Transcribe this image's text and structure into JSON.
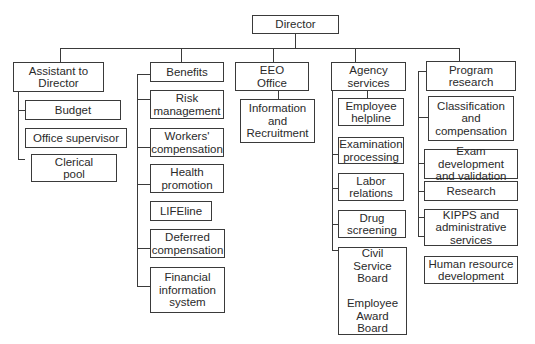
{
  "chart": {
    "root": "Director",
    "departments": [
      {
        "label": "Assistant to\nDirector",
        "children": [
          "Budget",
          "Office supervisor"
        ],
        "sub": {
          "Office supervisor": [
            "Clerical\npool"
          ]
        }
      },
      {
        "label": "Benefits",
        "children": [
          "Risk\nmanagement",
          "Workers'\ncompensation",
          "Health\npromotion",
          "LIFEline",
          "Deferred\ncompensation",
          "Financial\ninformation\nsystem"
        ]
      },
      {
        "label": "EEO\nOffice",
        "children": [
          "Information\nand\nRecruitment"
        ]
      },
      {
        "label": "Agency\nservices",
        "children": [
          "Employee\nhelpline",
          "Examination\nprocessing",
          "Labor\nrelations",
          "Drug\nscreening",
          "Civil\nService\nBoard\n\nEmployee\nAward\nBoard"
        ]
      },
      {
        "label": "Program\nresearch",
        "children": [
          "Classification\nand\ncompensation",
          "Exam development\nand validation",
          "Research",
          "KIPPS and\nadministrative\nservices",
          "Human resource\ndevelopment"
        ]
      }
    ]
  },
  "labels": {
    "director": "Director",
    "assistant": "Assistant to\nDirector",
    "budget": "Budget",
    "office_supervisor": "Office supervisor",
    "clerical_pool": "Clerical\npool",
    "benefits": "Benefits",
    "risk_management": "Risk\nmanagement",
    "workers_comp": "Workers'\ncompensation",
    "health_promotion": "Health\npromotion",
    "lifeline": "LIFEline",
    "deferred_comp": "Deferred\ncompensation",
    "financial_info": "Financial\ninformation\nsystem",
    "eeo_office": "EEO\nOffice",
    "info_recruitment": "Information\nand\nRecruitment",
    "agency_services": "Agency\nservices",
    "employee_helpline": "Employee\nhelpline",
    "exam_processing": "Examination\nprocessing",
    "labor_relations": "Labor\nrelations",
    "drug_screening": "Drug\nscreening",
    "civil_service_board": "Civil\nService\nBoard\n\nEmployee\nAward\nBoard",
    "program_research": "Program\nresearch",
    "classification_comp": "Classification\nand\ncompensation",
    "exam_dev": "Exam development\nand validation",
    "research": "Research",
    "kipps": "KIPPS and\nadministrative\nservices",
    "hr_development": "Human resource\ndevelopment"
  }
}
